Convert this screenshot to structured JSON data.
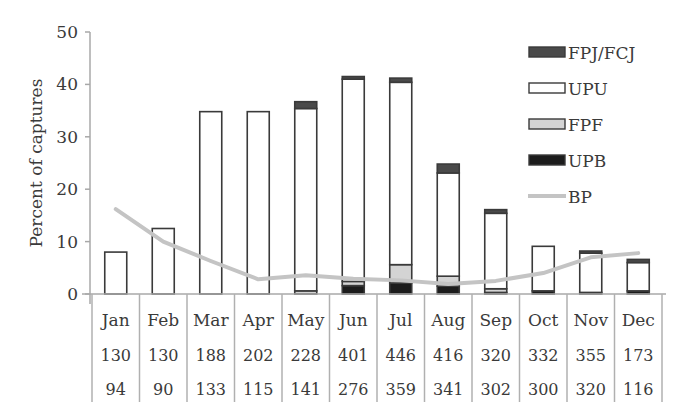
{
  "chart_data": {
    "type": "bar",
    "stacked": true,
    "title": "",
    "xlabel": "",
    "ylabel": "Percent of captures",
    "ylim": [
      0,
      50
    ],
    "yticks": [
      0,
      10,
      20,
      30,
      40,
      50
    ],
    "grid": false,
    "legend_position": "upper-right",
    "categories": [
      "Jan",
      "Feb",
      "Mar",
      "Apr",
      "May",
      "Jun",
      "Jul",
      "Aug",
      "Sep",
      "Oct",
      "Nov",
      "Dec"
    ],
    "series": [
      {
        "name": "UPB",
        "kind": "bar",
        "color": "#1c1c1c",
        "values": [
          0,
          0,
          0,
          0,
          0,
          1.6,
          2.1,
          1.5,
          0.3,
          0.6,
          0.3,
          0.6
        ]
      },
      {
        "name": "FPF",
        "kind": "bar",
        "color": "#d4d4d4",
        "values": [
          0,
          0,
          0,
          0,
          0.6,
          0.8,
          3.5,
          1.9,
          0.7,
          0,
          0,
          0
        ]
      },
      {
        "name": "UPU",
        "kind": "bar",
        "color": "#ffffff",
        "values": [
          8.0,
          12.5,
          34.8,
          34.8,
          34.8,
          38.6,
          34.8,
          19.7,
          14.4,
          8.5,
          7.5,
          5.4
        ]
      },
      {
        "name": "FPJ/FCJ",
        "kind": "bar",
        "color": "#4a4a4a",
        "values": [
          0,
          0,
          0,
          0,
          1.3,
          0.5,
          0.8,
          1.7,
          0.7,
          0,
          0.4,
          0.6
        ]
      },
      {
        "name": "BP",
        "kind": "line",
        "color": "#c4c4c4",
        "values": [
          16.2,
          10.0,
          6.3,
          2.8,
          3.6,
          2.9,
          2.6,
          1.9,
          2.5,
          4.0,
          7.0,
          7.8
        ]
      }
    ],
    "legend": [
      "FPJ/FCJ",
      "UPU",
      "FPF",
      "UPB",
      "BP"
    ],
    "table_rows": [
      {
        "name": "row1",
        "values": [
          "130",
          "130",
          "188",
          "202",
          "228",
          "401",
          "446",
          "416",
          "320",
          "332",
          "355",
          "173"
        ]
      },
      {
        "name": "row2",
        "values": [
          "94",
          "90",
          "133",
          "115",
          "141",
          "276",
          "359",
          "341",
          "302",
          "300",
          "320",
          "116"
        ]
      }
    ]
  }
}
